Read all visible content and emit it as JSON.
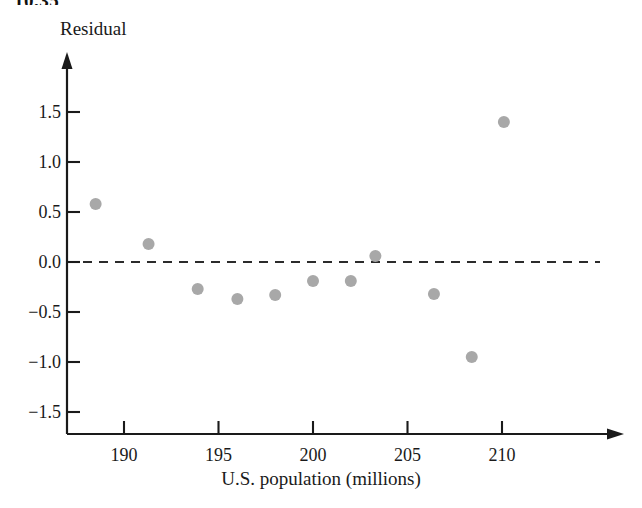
{
  "figure": {
    "number_label": "10.35",
    "y_axis_title": "Residual",
    "x_axis_title": "U.S. population (millions)"
  },
  "colors": {
    "axis": "#1a1a1a",
    "point_fill": "#a8a8a8",
    "reference_line": "#2b2b2b",
    "background": "#ffffff",
    "text": "#1a1a1a"
  },
  "chart_data": {
    "type": "scatter",
    "title": "",
    "subtitle": "",
    "xlabel": "U.S. population (millions)",
    "ylabel": "Residual",
    "xlim": [
      186.8,
      212.5
    ],
    "ylim": [
      -1.65,
      1.75
    ],
    "xticks": [
      190,
      195,
      200,
      205,
      210
    ],
    "yticks": [
      -1.5,
      -1.0,
      -0.5,
      0.0,
      0.5,
      1.0,
      1.5
    ],
    "xtick_labels": [
      "190",
      "195",
      "200",
      "205",
      "210"
    ],
    "ytick_labels": [
      "−1.5",
      "−1.0",
      "−0.5",
      "0.0",
      "0.5",
      "1.0",
      "1.5"
    ],
    "grid": false,
    "legend": null,
    "reference_line": {
      "type": "horizontal",
      "y": 0.0,
      "style": "dashed",
      "label": ""
    },
    "x": [
      188.5,
      191.3,
      193.9,
      196.0,
      198.0,
      200.0,
      202.0,
      203.3,
      206.4,
      208.4,
      210.1
    ],
    "y": [
      0.58,
      0.18,
      -0.27,
      -0.37,
      -0.33,
      -0.19,
      -0.19,
      0.06,
      -0.32,
      -0.95,
      1.4
    ],
    "points": [
      {
        "x": 188.5,
        "y": 0.58
      },
      {
        "x": 191.3,
        "y": 0.18
      },
      {
        "x": 193.9,
        "y": -0.27
      },
      {
        "x": 196.0,
        "y": -0.37
      },
      {
        "x": 198.0,
        "y": -0.33
      },
      {
        "x": 200.0,
        "y": -0.19
      },
      {
        "x": 202.0,
        "y": -0.19
      },
      {
        "x": 203.3,
        "y": 0.06
      },
      {
        "x": 206.4,
        "y": -0.32
      },
      {
        "x": 208.4,
        "y": -0.95
      },
      {
        "x": 210.1,
        "y": 1.4
      }
    ],
    "marker": {
      "shape": "circle",
      "radius": 6,
      "color": "#a8a8a8"
    }
  }
}
